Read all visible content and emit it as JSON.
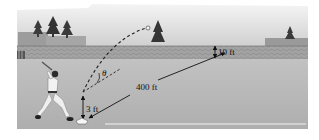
{
  "diagram": {
    "type": "illustration",
    "labels": {
      "distance": "400 ft",
      "batter_height": "3 ft",
      "fence_height": "10 ft",
      "angle": "θ"
    },
    "colors": {
      "sky_top": "#e8e8e8",
      "sky_bottom": "#d2d2d2",
      "fence": "#9a9a9a",
      "field": "#b9b9b9",
      "field_dark": "#a8a8a8",
      "trees": "#3a3a3a",
      "line": "#111111",
      "foul_line": "#f2f2f2"
    }
  }
}
